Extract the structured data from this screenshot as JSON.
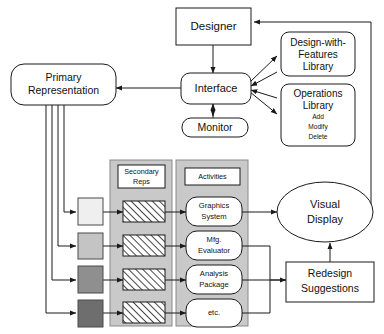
{
  "diagram": {
    "background": "#ffffff",
    "stroke_color": "#1a1a1a",
    "panel_fill": "#c9c9c9",
    "nodes": {
      "designer": {
        "label": "Designer",
        "shape": "rect"
      },
      "interface": {
        "label": "Interface",
        "shape": "rounded-rect"
      },
      "monitor": {
        "label": "Monitor",
        "shape": "rounded-rect"
      },
      "primary_representation": {
        "label_line1": "Primary",
        "label_line2": "Representation",
        "shape": "rounded-rect"
      },
      "design_with_features_library": {
        "label_line1": "Design-with-",
        "label_line2": "Features",
        "label_line3": "Library",
        "shape": "rounded-rect"
      },
      "operations_library": {
        "label_line1": "Operations",
        "label_line2": "Library",
        "operations": [
          "Add",
          "Modify",
          "Delete"
        ],
        "shape": "rounded-rect"
      },
      "visual_display": {
        "label_line1": "Visual",
        "label_line2": "Display",
        "shape": "ellipse"
      },
      "redesign_suggestions": {
        "label_line1": "Redesign",
        "label_line2": "Suggestions",
        "shape": "rect"
      }
    },
    "panels": [
      {
        "name": "secondary-reps",
        "header_line1": "Secondary",
        "header_line2": "Reps"
      },
      {
        "name": "activities",
        "header_line1": "Activities",
        "header_line2": ""
      }
    ],
    "representation_swatches": [
      {
        "name": "swatch-1",
        "color": "#efefef"
      },
      {
        "name": "swatch-2",
        "color": "#c4c4c4"
      },
      {
        "name": "swatch-3",
        "color": "#8f8f8f"
      },
      {
        "name": "swatch-4",
        "color": "#6e6e6e"
      }
    ],
    "secondary_reps": [
      {
        "name": "hatched-box-1",
        "fill": "hatch"
      },
      {
        "name": "hatched-box-2",
        "fill": "hatch"
      },
      {
        "name": "hatched-box-3",
        "fill": "hatch"
      },
      {
        "name": "hatched-box-4",
        "fill": "hatch"
      }
    ],
    "activities": [
      {
        "name": "graphics-system",
        "line1": "Graphics",
        "line2": "System"
      },
      {
        "name": "mfg-evaluator",
        "line1": "Mfg.",
        "line2": "Evaluator"
      },
      {
        "name": "analysis-package",
        "line1": "Analysis",
        "line2": "Package"
      },
      {
        "name": "etc",
        "line1": "etc.",
        "line2": ""
      }
    ]
  }
}
